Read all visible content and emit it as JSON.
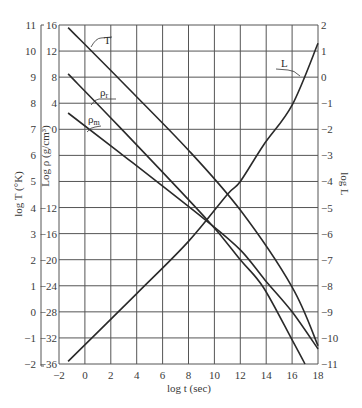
{
  "chart_data": {
    "type": "line",
    "title": "",
    "xlabel": "log t (sec)",
    "ylabel_left_outer": "log T (°K)",
    "ylabel_left_inner": "Log ρ (g/cm³)",
    "ylabel_right": "log L",
    "xlim": [
      -2,
      18
    ],
    "ylim_left_outer": [
      -2,
      11
    ],
    "ylim_left_inner": [
      -36,
      16
    ],
    "ylim_right": [
      -11,
      2
    ],
    "grid": true,
    "x_ticks": [
      -2,
      0,
      2,
      4,
      6,
      8,
      10,
      12,
      14,
      16,
      18
    ],
    "y_ticks_left_outer": [
      11,
      10,
      9,
      8,
      7,
      6,
      5,
      4,
      3,
      2,
      1,
      0,
      -1,
      -2
    ],
    "y_ticks_left_inner": [
      16,
      12,
      8,
      4,
      0,
      -4,
      -8,
      -12,
      -16,
      -20,
      -24,
      -28,
      -32,
      -36
    ],
    "y_ticks_left_inner_visible": [
      "16",
      "12",
      "8",
      "4",
      "0",
      "",
      "",
      "−12",
      "−16",
      "−20",
      "−24",
      "−28",
      "−32",
      "−36"
    ],
    "y_ticks_right": [
      2,
      1,
      0,
      -1,
      -2,
      -3,
      -4,
      -5,
      -6,
      -7,
      -8,
      -9,
      -10,
      -11
    ],
    "series": [
      {
        "name": "T",
        "axis": "left_outer (log T)",
        "x": [
          -1.3,
          2.7,
          8.0,
          12.0,
          16.0,
          18.0
        ],
        "y": [
          10.9,
          8.9,
          6.2,
          3.9,
          0.95,
          -1.3
        ]
      },
      {
        "name": "ρr",
        "axis": "left_inner (log ρ)",
        "x": [
          -1.3,
          2.7,
          9.4,
          12.0,
          13.8,
          16.0,
          17.0
        ],
        "y": [
          8.5,
          0.3,
          -13.8,
          -20.0,
          -24.3,
          -32.3,
          -36.0
        ]
      },
      {
        "name": "ρm",
        "axis": "left_inner (log ρ)",
        "x": [
          -1.3,
          2.7,
          9.3,
          12.0,
          13.9,
          16.0,
          18.0
        ],
        "y": [
          2.5,
          -3.6,
          -13.9,
          -18.5,
          -23.1,
          -28.0,
          -33.7
        ]
      },
      {
        "name": "L",
        "axis": "right (log L)",
        "x": [
          -1.3,
          4.0,
          8.0,
          11.0,
          12.0,
          13.8,
          16.0,
          18.0
        ],
        "y": [
          -10.9,
          -8.3,
          -6.3,
          -4.5,
          -4.0,
          -2.6,
          -1.07,
          1.3
        ]
      }
    ],
    "annotations": [
      {
        "text": "T",
        "target": "T"
      },
      {
        "text": "ρr",
        "target": "ρr"
      },
      {
        "text": "ρm",
        "target": "ρm"
      },
      {
        "text": "L",
        "target": "L"
      }
    ]
  }
}
